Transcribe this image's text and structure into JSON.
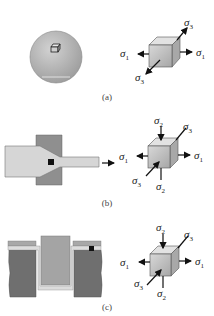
{
  "figure": {
    "panels": [
      {
        "id": "a",
        "caption": "(a)",
        "specimen": "sphere with small cube element on surface",
        "stress_labels": {
          "sigma1_left": "σ",
          "sigma1_left_sub": "1",
          "sigma1_right": "σ",
          "sigma1_right_sub": "1",
          "sigma3_top": "σ",
          "sigma3_top_sub": "3",
          "sigma3_bottom": "σ",
          "sigma3_bottom_sub": "3"
        }
      },
      {
        "id": "b",
        "caption": "(b)",
        "specimen": "wire/rod drawn through a die",
        "stress_labels": {
          "sigma2_top": "σ",
          "sigma2_top_sub": "2",
          "sigma3_top": "σ",
          "sigma3_top_sub": "3",
          "sigma1_left": "σ",
          "sigma1_left_sub": "1",
          "sigma1_right": "σ",
          "sigma1_right_sub": "1",
          "sigma3_bottom": "σ",
          "sigma3_bottom_sub": "3",
          "sigma2_bottom": "σ",
          "sigma2_bottom_sub": "2"
        }
      },
      {
        "id": "c",
        "caption": "(c)",
        "specimen": "sheet drawn into a die by a punch (deep drawing)",
        "stress_labels": {
          "sigma2_top": "σ",
          "sigma2_top_sub": "2",
          "sigma3_top": "σ",
          "sigma3_top_sub": "3",
          "sigma1_left": "σ",
          "sigma1_left_sub": "1",
          "sigma1_right": "σ",
          "sigma1_right_sub": "1",
          "sigma3_bottom": "σ",
          "sigma3_bottom_sub": "3",
          "sigma2_bottom": "σ",
          "sigma2_bottom_sub": "2"
        }
      }
    ],
    "colors": {
      "sphere": "#b8b8b8",
      "workpiece_light": "#d4d4d4",
      "die_dark": "#7a7a7a",
      "die_medium": "#9a9a9a",
      "cube_face": "#c8c8c8",
      "cube_top": "#dedede",
      "cube_side": "#a8a8a8",
      "element_marker": "#111111"
    }
  }
}
